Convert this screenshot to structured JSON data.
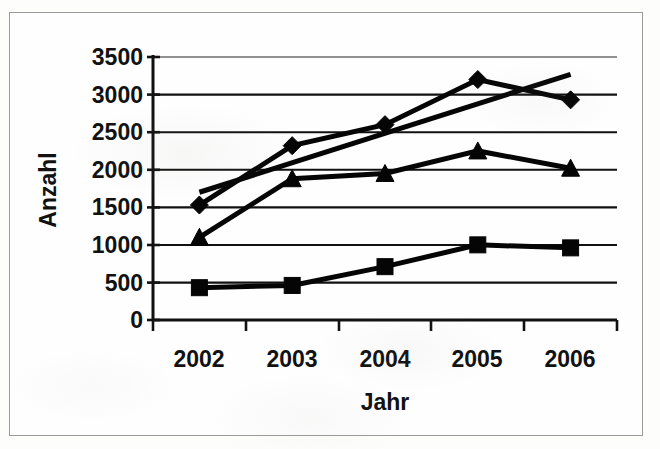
{
  "figure": {
    "kind": "scanned-line-chart",
    "frame_border_color": "#9a9a96",
    "ink_color": "#050505",
    "paper_color": "#fefefe"
  },
  "axes": {
    "y_title": "Anzahl",
    "x_title": "Jahr",
    "y_ticks": [
      "0",
      "500",
      "1000",
      "1500",
      "2000",
      "2500",
      "3000",
      "3500"
    ],
    "x_ticks": [
      "2002",
      "2003",
      "2004",
      "2005",
      "2006"
    ]
  },
  "chart_data": {
    "type": "line",
    "title": "",
    "subtitle": "",
    "xlabel": "Jahr",
    "ylabel": "Anzahl",
    "categories": [
      "2002",
      "2003",
      "2004",
      "2005",
      "2006"
    ],
    "x": [
      2002,
      2003,
      2004,
      2005,
      2006
    ],
    "ylim": [
      0,
      3500
    ],
    "ytick_step": 500,
    "yticks": [
      0,
      500,
      1000,
      1500,
      2000,
      2500,
      3000,
      3500
    ],
    "grid": true,
    "grid_axis": "y",
    "legend": false,
    "legend_position": "none",
    "series": [
      {
        "name": "Serie 1",
        "marker": "diamond",
        "color": "#050505",
        "values": [
          1530,
          2320,
          2600,
          3200,
          2930
        ]
      },
      {
        "name": "Serie 2",
        "marker": "triangle",
        "color": "#050505",
        "values": [
          1100,
          1880,
          1950,
          2250,
          2020
        ]
      },
      {
        "name": "Serie 3",
        "marker": "square",
        "color": "#050505",
        "values": [
          430,
          460,
          710,
          1000,
          960
        ]
      },
      {
        "name": "Trendlinie",
        "marker": "none",
        "color": "#050505",
        "values": [
          1700,
          2090,
          2480,
          2880,
          3270
        ],
        "note": "gerade Linie ohne Datenpunktmarker"
      }
    ],
    "annotations": []
  }
}
